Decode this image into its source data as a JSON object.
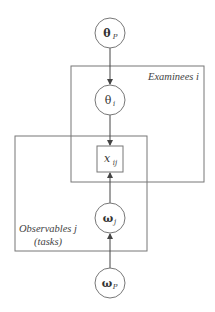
{
  "diagram": {
    "type": "plate-notation",
    "stroke_color": "#666666",
    "nodes": [
      {
        "id": "theta_P",
        "label": "θ",
        "sub": "P",
        "bold": true,
        "shape": "circle",
        "cx": 110,
        "cy": 33,
        "r": 15
      },
      {
        "id": "theta_i",
        "label": "θ",
        "sub": "i",
        "bold": false,
        "shape": "circle",
        "cx": 110,
        "cy": 100,
        "r": 15
      },
      {
        "id": "x_ij",
        "label": "x",
        "sub": "ij",
        "bold": false,
        "shape": "square",
        "x": 97,
        "y": 146,
        "w": 26,
        "h": 26
      },
      {
        "id": "omega_j",
        "label": "ω",
        "sub": "j",
        "bold": true,
        "shape": "circle",
        "cx": 110,
        "cy": 218,
        "r": 15
      },
      {
        "id": "omega_P",
        "label": "ω",
        "sub": "P",
        "bold": true,
        "shape": "circle",
        "cx": 110,
        "cy": 283,
        "r": 15
      }
    ],
    "edges": [
      {
        "from": "theta_P",
        "to": "theta_i"
      },
      {
        "from": "theta_i",
        "to": "x_ij"
      },
      {
        "from": "omega_j",
        "to": "x_ij"
      },
      {
        "from": "omega_P",
        "to": "omega_j"
      }
    ],
    "plates": [
      {
        "id": "examinees",
        "label": "Examinees i",
        "x": 71,
        "y": 66,
        "w": 133,
        "h": 116
      },
      {
        "id": "observables",
        "label_line1": "Observables j",
        "label_line2": "(tasks)",
        "x": 15,
        "y": 136,
        "w": 132,
        "h": 115
      }
    ]
  }
}
